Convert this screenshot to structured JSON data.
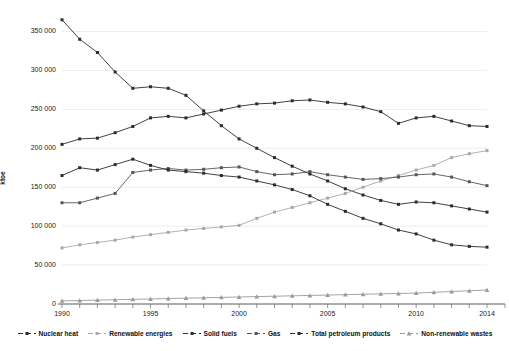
{
  "chart_data": {
    "type": "line",
    "title": "",
    "subtitle": "",
    "xlabel": "",
    "ylabel": "ktoe",
    "grid": true,
    "legend_position": "bottom",
    "xlim": [
      1990,
      2014
    ],
    "ylim": [
      0,
      375000
    ],
    "yticks": [
      0,
      50000,
      100000,
      150000,
      200000,
      250000,
      300000,
      350000
    ],
    "ytick_labels": [
      "0",
      "50 000",
      "100 000",
      "150 000",
      "200 000",
      "250 000",
      "300 000",
      "350 000"
    ],
    "xticks": [
      1990,
      1995,
      2000,
      2005,
      2010,
      2014
    ],
    "xtick_labels": [
      "1990",
      "1995",
      "2000",
      "2005",
      "2010",
      "2014"
    ],
    "x": [
      1990,
      1991,
      1992,
      1993,
      1994,
      1995,
      1996,
      1997,
      1998,
      1999,
      2000,
      2001,
      2002,
      2003,
      2004,
      2005,
      2006,
      2007,
      2008,
      2009,
      2010,
      2011,
      2012,
      2013,
      2014
    ],
    "series": [
      {
        "name": "Nuclear heat",
        "color": "#2b2b2b",
        "marker": "square",
        "values": [
          365000,
          340000,
          323000,
          298000,
          277000,
          279000,
          277000,
          268000,
          248000,
          229000,
          212000,
          200000,
          188000,
          177000,
          167000,
          158000,
          148000,
          140000,
          133000,
          128000,
          131000,
          130000,
          126000,
          122000,
          118000
        ]
      },
      {
        "name": "Renewable energies",
        "color": "#a8a8a8",
        "marker": "square",
        "values": [
          72000,
          76000,
          79000,
          82000,
          86000,
          89000,
          92000,
          95000,
          97000,
          99000,
          101000,
          110000,
          118000,
          124000,
          130000,
          136000,
          142000,
          150000,
          158000,
          165000,
          172000,
          178000,
          188000,
          193000,
          197000
        ]
      },
      {
        "name": "Solid fuels",
        "color": "#2b2b2b",
        "marker": "square",
        "values": [
          205000,
          212000,
          213000,
          220000,
          228000,
          239000,
          241000,
          239000,
          244000,
          249000,
          254000,
          257000,
          258000,
          261000,
          262000,
          259000,
          257000,
          253000,
          247000,
          232000,
          239000,
          241000,
          235000,
          229000,
          228000
        ]
      },
      {
        "name": "Gas",
        "color": "#555555",
        "marker": "square",
        "values": [
          130000,
          130000,
          136000,
          142000,
          169000,
          172000,
          174000,
          172000,
          173000,
          175000,
          176000,
          170000,
          166000,
          167000,
          170000,
          166000,
          163000,
          160000,
          161000,
          163000,
          166000,
          167000,
          163000,
          157000,
          152000
        ]
      },
      {
        "name": "Total petroleum products",
        "color": "#2b2b2b",
        "marker": "square",
        "values": [
          165000,
          175000,
          172000,
          179000,
          186000,
          178000,
          172000,
          170000,
          168000,
          165000,
          163000,
          158000,
          153000,
          147000,
          139000,
          128000,
          119000,
          110000,
          103000,
          95000,
          90000,
          82000,
          76000,
          74000,
          73000
        ]
      },
      {
        "name": "Non-renewable wastes",
        "color": "#9a9a9a",
        "marker": "triangle",
        "values": [
          4000,
          4500,
          5000,
          5500,
          6000,
          6500,
          7000,
          7500,
          8000,
          8500,
          9000,
          9500,
          10000,
          10500,
          11000,
          11500,
          12000,
          12500,
          13000,
          13500,
          14000,
          15000,
          16000,
          17000,
          18000
        ]
      }
    ]
  },
  "axes": {
    "ylabel": "ktoe"
  },
  "legend": {
    "items": [
      {
        "label": "Nuclear heat"
      },
      {
        "label": "Renewable energies"
      },
      {
        "label": "Solid fuels"
      },
      {
        "label": "Gas"
      },
      {
        "label": "Total petroleum products"
      },
      {
        "label": "Non-renewable wastes"
      }
    ]
  }
}
